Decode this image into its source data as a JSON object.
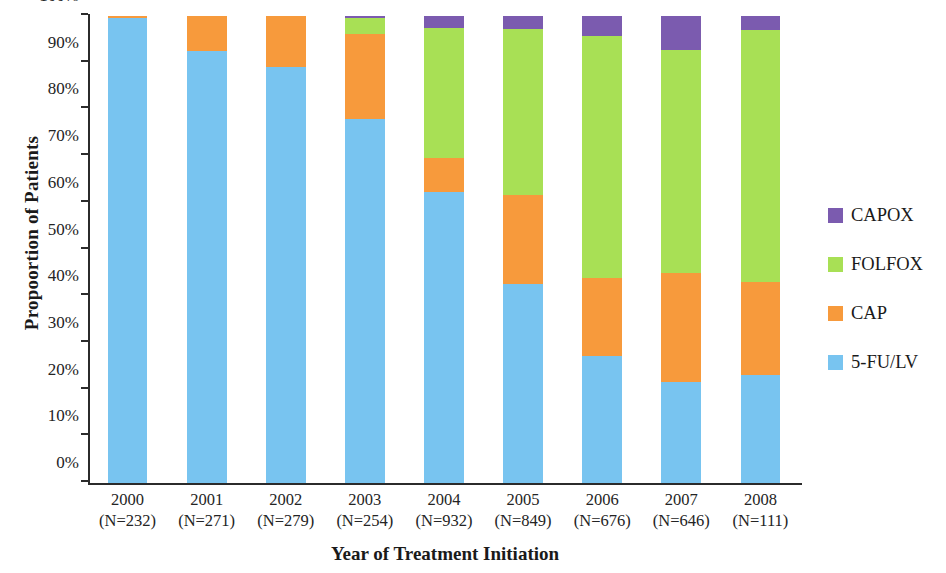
{
  "chart_data": {
    "type": "bar",
    "stacked": true,
    "stack_mode": "percent",
    "title": "",
    "xlabel": "Year of Treatment Initiation",
    "ylabel": "Propoortion of Patients",
    "ylim": [
      0,
      100
    ],
    "yticks": [
      "0%",
      "10%",
      "20%",
      "30%",
      "40%",
      "50%",
      "60%",
      "70%",
      "80%",
      "90%",
      "100%"
    ],
    "ytick_values": [
      0,
      10,
      20,
      30,
      40,
      50,
      60,
      70,
      80,
      90,
      100
    ],
    "grid": false,
    "legend_position": "right",
    "categories": [
      "2000",
      "2001",
      "2002",
      "2003",
      "2004",
      "2005",
      "2006",
      "2007",
      "2008"
    ],
    "category_counts": [
      "(N=232)",
      "(N=271)",
      "(N=279)",
      "(N=254)",
      "(N=932)",
      "(N=849)",
      "(N=676)",
      "(N=646)",
      "(N=111)"
    ],
    "series": [
      {
        "name": "5-FU/LV",
        "color": "#78C4F0",
        "values": [
          99.5,
          92.5,
          89.0,
          78.0,
          62.3,
          42.6,
          27.2,
          21.6,
          23.2
        ]
      },
      {
        "name": "CAP",
        "color": "#F79A3C",
        "values": [
          0.5,
          7.5,
          11.0,
          18.2,
          7.2,
          19.0,
          16.8,
          23.4,
          19.9
        ]
      },
      {
        "name": "FOLFOX",
        "color": "#A8E055",
        "values": [
          0.0,
          0.0,
          0.0,
          3.3,
          28.0,
          35.6,
          51.7,
          47.7,
          53.9
        ]
      },
      {
        "name": "CAPOX",
        "color": "#7B5BAF",
        "values": [
          0.0,
          0.0,
          0.0,
          0.5,
          2.5,
          2.8,
          4.3,
          7.3,
          3.0
        ]
      }
    ]
  },
  "legend": {
    "items": [
      {
        "label": "CAPOX",
        "color": "#7B5BAF"
      },
      {
        "label": "FOLFOX",
        "color": "#A8E055"
      },
      {
        "label": "CAP",
        "color": "#F79A3C"
      },
      {
        "label": "5-FU/LV",
        "color": "#78C4F0"
      }
    ]
  }
}
